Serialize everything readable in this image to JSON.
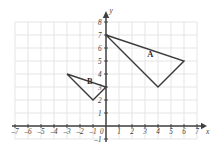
{
  "chart_data": {
    "type": "scatter",
    "title": "",
    "xlabel": "x",
    "ylabel": "y",
    "xlim": [
      -7,
      7
    ],
    "ylim": [
      -1,
      8
    ],
    "grid": true,
    "legend": "none",
    "x_ticks": [
      "-7",
      "-6",
      "-5",
      "-4",
      "-3",
      "-2",
      "-1",
      "0",
      "1",
      "2",
      "3",
      "4",
      "5",
      "6",
      "7"
    ],
    "y_ticks": [
      "-1",
      "1",
      "2",
      "3",
      "4",
      "5",
      "6",
      "7",
      "8"
    ],
    "origin_label": "0",
    "shapes": [
      {
        "name": "A",
        "label": "A",
        "label_position": [
          3.4,
          5.3
        ],
        "vertices": [
          [
            0,
            7
          ],
          [
            6,
            5
          ],
          [
            4,
            3
          ]
        ],
        "stroke": "#3a3a3a",
        "fill": "none"
      },
      {
        "name": "B",
        "label": "B",
        "label_position": [
          -1.25,
          3.25
        ],
        "vertices": [
          [
            -3,
            4
          ],
          [
            0,
            3
          ],
          [
            -1,
            2
          ]
        ],
        "stroke": "#3a3a3a",
        "fill": "none"
      }
    ]
  },
  "colors": {
    "grid": "#e2e2e2",
    "axis": "#404040",
    "shape_stroke": "#3a3a3a",
    "text": "#3b3b3b",
    "background": "#ffffff"
  }
}
